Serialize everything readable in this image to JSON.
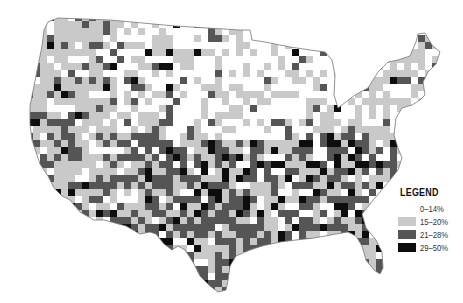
{
  "map": {
    "type": "choropleth",
    "region": "Contiguous United States (counties)",
    "colors": {
      "c0": "#ffffff",
      "c1": "#c9c9c9",
      "c2": "#555555",
      "c3": "#0d0d0d",
      "outline": "#777777"
    }
  },
  "legend": {
    "title": "LEGEND",
    "items": [
      {
        "label": "0–14%",
        "color": "#ffffff"
      },
      {
        "label": "15–20%",
        "color": "#c9c9c9"
      },
      {
        "label": "21–28%",
        "color": "#555555"
      },
      {
        "label": "29–50%",
        "color": "#0d0d0d"
      }
    ]
  }
}
